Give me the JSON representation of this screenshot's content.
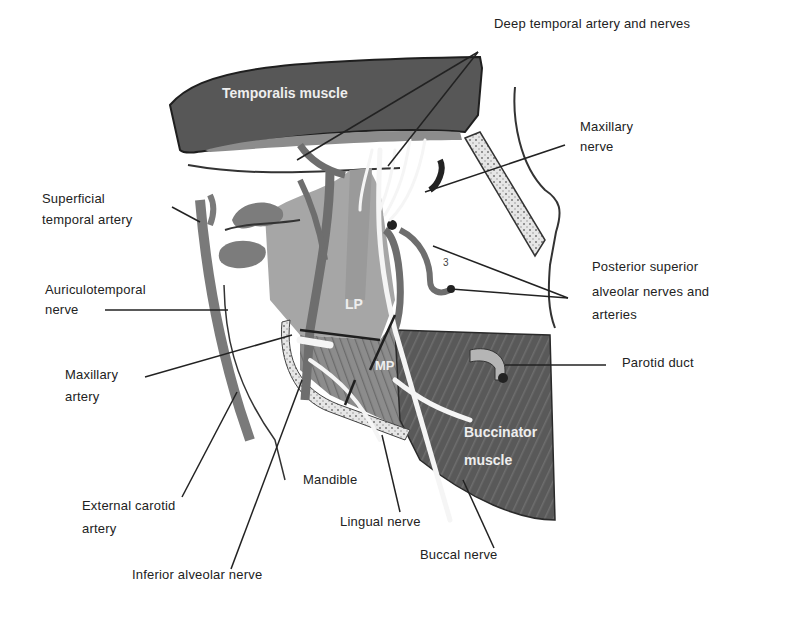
{
  "diagram": {
    "colors": {
      "muscle_dark": "#5a5a5a",
      "muscle_mid": "#8a8a8a",
      "pterygoid_light": "#a8a8a8",
      "vessel": "#7a7a7a",
      "nerve": "#f4f4f4",
      "outline": "#222222",
      "bone_dotted": "#d8d8d8"
    },
    "inside_labels": {
      "temporalis": "Temporalis muscle",
      "lp": "LP",
      "mp": "MP",
      "buccinator_line1": "Buccinator",
      "buccinator_line2": "muscle",
      "number_3": "3"
    },
    "callouts": {
      "deep_temporal": "Deep temporal artery and nerves",
      "maxillary_nerve_1": "Maxillary",
      "maxillary_nerve_2": "nerve",
      "superficial_temporal_1": "Superficial",
      "superficial_temporal_2": "temporal artery",
      "auriculotemporal_1": "Auriculotemporal",
      "auriculotemporal_2": "nerve",
      "posterior_superior_1": "Posterior superior",
      "posterior_superior_2": "alveolar nerves and",
      "posterior_superior_3": "arteries",
      "maxillary_artery_1": "Maxillary",
      "maxillary_artery_2": "artery",
      "parotid_duct": "Parotid duct",
      "mandible": "Mandible",
      "external_carotid_1": "External carotid",
      "external_carotid_2": "artery",
      "lingual_nerve": "Lingual nerve",
      "buccal_nerve": "Buccal nerve",
      "inferior_alveolar": "Inferior alveolar nerve"
    }
  }
}
